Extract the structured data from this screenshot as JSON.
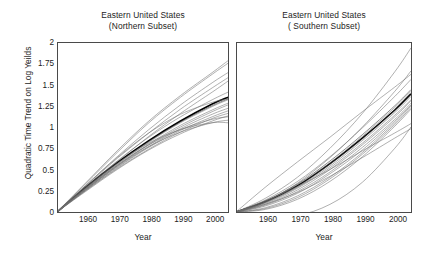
{
  "chart_data": {
    "type": "line",
    "xlabel": "Year",
    "ylabel": "Quadratic Time Trend on Log Yeilds",
    "xlim": [
      1951,
      2005
    ],
    "ylim": [
      0,
      2
    ],
    "xticks": [
      1960,
      1970,
      1980,
      1990,
      2000
    ],
    "yticks": [
      0,
      0.25,
      0.5,
      0.75,
      1,
      1.25,
      1.5,
      1.75,
      2
    ],
    "xtick_labels": [
      "1960",
      "1970",
      "1980",
      "1990",
      "2000"
    ],
    "ytick_labels": [
      "0",
      "0.25",
      "0.5",
      "0.75",
      "1",
      "1.25",
      "1.5",
      "1.75",
      "2"
    ],
    "grid": false,
    "legend": "none",
    "x": [
      1951,
      1960,
      1970,
      1980,
      1990,
      2000,
      2005
    ],
    "panels": [
      {
        "id": "northern",
        "title_line1": "Eastern United States",
        "title_line2": "(Northern Subset)",
        "xlabel": "Year",
        "series": [
          {
            "name": "mean",
            "emphasis": "bold",
            "values": [
              0,
              0.29,
              0.58,
              0.84,
              1.07,
              1.27,
              1.35
            ]
          },
          {
            "name": "state-1",
            "emphasis": "thin",
            "values": [
              0,
              0.34,
              0.72,
              1.07,
              1.37,
              1.64,
              1.78
            ]
          },
          {
            "name": "state-2",
            "emphasis": "thin",
            "values": [
              0,
              0.33,
              0.7,
              1.05,
              1.35,
              1.62,
              1.75
            ]
          },
          {
            "name": "state-3",
            "emphasis": "thin",
            "values": [
              0,
              0.31,
              0.65,
              0.97,
              1.26,
              1.52,
              1.64
            ]
          },
          {
            "name": "state-4",
            "emphasis": "thin",
            "values": [
              0,
              0.3,
              0.63,
              0.93,
              1.21,
              1.46,
              1.58
            ]
          },
          {
            "name": "state-5",
            "emphasis": "thin",
            "values": [
              0,
              0.28,
              0.59,
              0.89,
              1.16,
              1.41,
              1.54
            ]
          },
          {
            "name": "state-6",
            "emphasis": "thin",
            "values": [
              0,
              0.29,
              0.6,
              0.88,
              1.12,
              1.32,
              1.41
            ]
          },
          {
            "name": "state-7",
            "emphasis": "dark",
            "values": [
              0,
              0.28,
              0.57,
              0.83,
              1.06,
              1.25,
              1.33
            ]
          },
          {
            "name": "state-8",
            "emphasis": "thin",
            "values": [
              0,
              0.27,
              0.56,
              0.82,
              1.05,
              1.24,
              1.32
            ]
          },
          {
            "name": "state-9",
            "emphasis": "thin",
            "values": [
              0,
              0.27,
              0.55,
              0.8,
              1.02,
              1.2,
              1.28
            ]
          },
          {
            "name": "state-10",
            "emphasis": "thin",
            "values": [
              0,
              0.26,
              0.54,
              0.79,
              1.0,
              1.18,
              1.26
            ]
          },
          {
            "name": "state-11",
            "emphasis": "thin",
            "values": [
              0,
              0.26,
              0.53,
              0.77,
              0.98,
              1.15,
              1.22
            ]
          },
          {
            "name": "state-12",
            "emphasis": "thin",
            "values": [
              0,
              0.25,
              0.52,
              0.76,
              0.96,
              1.12,
              1.19
            ]
          },
          {
            "name": "state-13",
            "emphasis": "thin",
            "values": [
              0,
              0.25,
              0.51,
              0.74,
              0.94,
              1.1,
              1.16
            ]
          },
          {
            "name": "state-14",
            "emphasis": "thin",
            "values": [
              0,
              0.24,
              0.5,
              0.73,
              0.92,
              1.07,
              1.13
            ]
          },
          {
            "name": "state-15",
            "emphasis": "thin",
            "values": [
              0,
              0.27,
              0.55,
              0.79,
              0.97,
              1.09,
              1.12
            ]
          },
          {
            "name": "state-16",
            "emphasis": "thin",
            "values": [
              0,
              0.26,
              0.54,
              0.77,
              0.94,
              1.05,
              1.08
            ]
          },
          {
            "name": "state-17",
            "emphasis": "thin",
            "values": [
              0,
              0.28,
              0.57,
              0.81,
              0.97,
              1.05,
              1.05
            ]
          },
          {
            "name": "state-18",
            "emphasis": "thin",
            "values": [
              0,
              0.31,
              0.64,
              0.93,
              1.15,
              1.29,
              1.33
            ]
          }
        ]
      },
      {
        "id": "southern",
        "title_line1": "Eastern United States",
        "title_line2": "( Southern Subset)",
        "xlabel": "Year",
        "series": [
          {
            "name": "mean",
            "emphasis": "bold",
            "values": [
              0,
              0.12,
              0.31,
              0.57,
              0.87,
              1.2,
              1.39
            ]
          },
          {
            "name": "state-1",
            "emphasis": "thin",
            "values": [
              0,
              0.16,
              0.41,
              0.75,
              1.16,
              1.65,
              1.93
            ]
          },
          {
            "name": "state-2",
            "emphasis": "thin",
            "values": [
              0,
              0.29,
              0.59,
              0.88,
              1.18,
              1.47,
              1.62
            ]
          },
          {
            "name": "state-3",
            "emphasis": "thin",
            "values": [
              0,
              0.12,
              0.34,
              0.64,
              1.0,
              1.42,
              1.66
            ]
          },
          {
            "name": "state-4",
            "emphasis": "thin",
            "values": [
              0,
              0.14,
              0.36,
              0.65,
              0.99,
              1.36,
              1.56
            ]
          },
          {
            "name": "state-5",
            "emphasis": "dark",
            "values": [
              0,
              0.13,
              0.33,
              0.6,
              0.91,
              1.25,
              1.44
            ]
          },
          {
            "name": "state-6",
            "emphasis": "thin",
            "values": [
              0,
              0.12,
              0.32,
              0.58,
              0.89,
              1.23,
              1.42
            ]
          },
          {
            "name": "state-7",
            "emphasis": "thin",
            "values": [
              0,
              0.11,
              0.3,
              0.56,
              0.86,
              1.19,
              1.38
            ]
          },
          {
            "name": "state-8",
            "emphasis": "thin",
            "values": [
              0,
              0.11,
              0.29,
              0.54,
              0.84,
              1.17,
              1.36
            ]
          },
          {
            "name": "state-9",
            "emphasis": "thin",
            "values": [
              0,
              0.1,
              0.28,
              0.52,
              0.81,
              1.14,
              1.32
            ]
          },
          {
            "name": "state-10",
            "emphasis": "thin",
            "values": [
              0,
              0.09,
              0.26,
              0.5,
              0.79,
              1.12,
              1.31
            ]
          },
          {
            "name": "state-11",
            "emphasis": "thin",
            "values": [
              0,
              0.08,
              0.24,
              0.47,
              0.76,
              1.09,
              1.28
            ]
          },
          {
            "name": "state-12",
            "emphasis": "thin",
            "values": [
              0,
              0.07,
              0.22,
              0.45,
              0.73,
              1.07,
              1.26
            ]
          },
          {
            "name": "state-13",
            "emphasis": "thin",
            "values": [
              0,
              0.05,
              0.19,
              0.41,
              0.7,
              1.05,
              1.25
            ]
          },
          {
            "name": "state-14",
            "emphasis": "thin",
            "values": [
              0,
              0.04,
              0.17,
              0.39,
              0.68,
              1.03,
              1.23
            ]
          },
          {
            "name": "state-15",
            "emphasis": "thin",
            "values": [
              0,
              0.03,
              0.15,
              0.36,
              0.65,
              1.01,
              1.21
            ]
          },
          {
            "name": "state-16",
            "emphasis": "thin",
            "values": [
              0,
              0.13,
              0.3,
              0.5,
              0.72,
              0.93,
              1.04
            ]
          },
          {
            "name": "state-17",
            "emphasis": "thin",
            "values": [
              0,
              0.09,
              0.23,
              0.42,
              0.64,
              0.87,
              0.98
            ]
          },
          {
            "name": "state-18",
            "emphasis": "thin",
            "values": [
              0,
              -0.04,
              -0.04,
              0.09,
              0.35,
              0.75,
              1.0
            ]
          }
        ]
      }
    ]
  }
}
